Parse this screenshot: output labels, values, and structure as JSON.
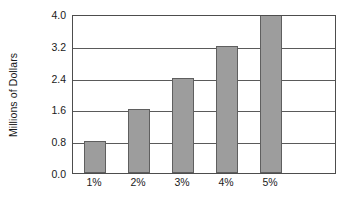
{
  "chart_data": {
    "type": "bar",
    "title": "",
    "xlabel": "",
    "ylabel": "Millions of Dollars",
    "categories": [
      "1%",
      "2%",
      "3%",
      "4%",
      "5%"
    ],
    "values": [
      0.8,
      1.6,
      2.4,
      3.2,
      4.0
    ],
    "ylim": [
      0.0,
      4.0
    ],
    "ytick_labels": [
      "0.0",
      "0.8",
      "1.6",
      "2.4",
      "3.2",
      "4.0"
    ],
    "ytick_values": [
      0.0,
      0.8,
      1.6,
      2.4,
      3.2,
      4.0
    ],
    "grid": "horizontal",
    "legend": "none",
    "bar_color": "#9d9d9d",
    "bar_edge_color": "#5f5f5f",
    "grid_color": "#5a5a5a",
    "frame_color": "#4d4d4d",
    "background_color": "#ffffff",
    "x_category_slots": 6
  }
}
